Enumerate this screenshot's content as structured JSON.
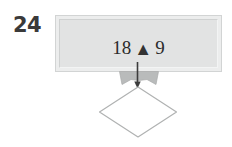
{
  "figure": {
    "problem_number": "24",
    "equation": {
      "left_operand": "18",
      "operator_icon": "filled-triangle",
      "operator_glyph": "▲",
      "right_operand": "9",
      "full_text": "18 ▲ 9"
    },
    "shapes": {
      "box_label": "beveled-rectangle",
      "arrow_label": "down-arrow",
      "arrow_direction": "down",
      "wing_label": "gray-fin",
      "diamond_label": "white-diamond",
      "diamond_fill": "#ffffff"
    },
    "colors": {
      "page_background": "#ffffff",
      "box_fill": "#e2e3e3",
      "box_frame": "#eceded",
      "box_border": "#d2d4d4",
      "text": "#2b2b2b",
      "number_label": "#3a3a3a",
      "arrow": "#3c3c3c",
      "wing_fill": "#b9bbbb",
      "diamond_stroke": "#b0b2b2"
    }
  }
}
